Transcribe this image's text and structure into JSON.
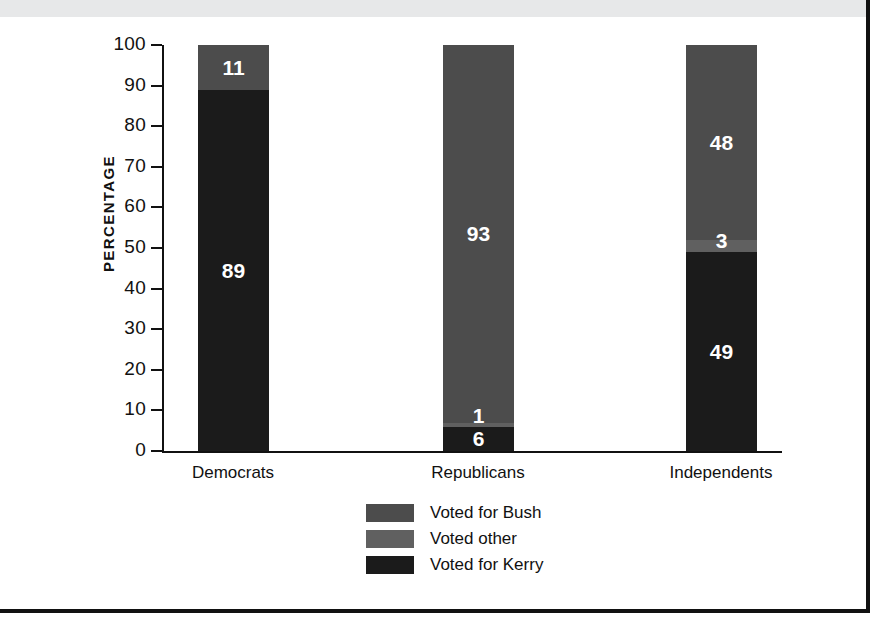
{
  "chart_data": {
    "type": "bar",
    "subtype": "stacked-vertical-100pct",
    "title": "",
    "xlabel": "",
    "ylabel": "PERCENTAGE",
    "ylim": [
      0,
      100
    ],
    "ytick_step": 10,
    "yticks": [
      100,
      90,
      80,
      70,
      60,
      50,
      40,
      30,
      20,
      10,
      0
    ],
    "grid": false,
    "legend_position": "bottom-center",
    "categories": [
      "Democrats",
      "Republicans",
      "Independents"
    ],
    "series": [
      {
        "name": "Voted for Bush",
        "color": "#4c4c4c",
        "values": [
          11,
          93,
          48
        ]
      },
      {
        "name": "Voted other",
        "color": "#606060",
        "values": [
          0,
          1,
          3
        ]
      },
      {
        "name": "Voted for Kerry",
        "color": "#1b1b1b",
        "values": [
          89,
          6,
          49
        ]
      }
    ],
    "bars": [
      {
        "category": "Democrats",
        "segments": [
          {
            "series": "Voted for Bush",
            "value": 11,
            "label": "11",
            "color": "#4c4c4c",
            "label_visible": true
          },
          {
            "series": "Voted other",
            "value": 0,
            "label": "",
            "color": "#606060",
            "label_visible": false
          },
          {
            "series": "Voted for Kerry",
            "value": 89,
            "label": "89",
            "color": "#1b1b1b",
            "label_visible": true
          }
        ]
      },
      {
        "category": "Republicans",
        "segments": [
          {
            "series": "Voted for Bush",
            "value": 93,
            "label": "93",
            "color": "#4c4c4c",
            "label_visible": true
          },
          {
            "series": "Voted other",
            "value": 1,
            "label": "1",
            "color": "#606060",
            "label_visible": true
          },
          {
            "series": "Voted for Kerry",
            "value": 6,
            "label": "6",
            "color": "#1b1b1b",
            "label_visible": true
          }
        ]
      },
      {
        "category": "Independents",
        "segments": [
          {
            "series": "Voted for Bush",
            "value": 48,
            "label": "48",
            "color": "#4c4c4c",
            "label_visible": true
          },
          {
            "series": "Voted other",
            "value": 3,
            "label": "3",
            "color": "#606060",
            "label_visible": true
          },
          {
            "series": "Voted for Kerry",
            "value": 49,
            "label": "49",
            "color": "#1b1b1b",
            "label_visible": true
          }
        ]
      }
    ]
  },
  "legend": {
    "entries": [
      {
        "label": "Voted for Bush",
        "color": "#4c4c4c"
      },
      {
        "label": "Voted other",
        "color": "#606060"
      },
      {
        "label": "Voted for Kerry",
        "color": "#1b1b1b"
      }
    ]
  },
  "colors": {
    "bush": "#4c4c4c",
    "other": "#606060",
    "kerry": "#1b1b1b",
    "axis": "#111111",
    "page_band": "#e7e8e9",
    "value_label": "#ffffff"
  }
}
